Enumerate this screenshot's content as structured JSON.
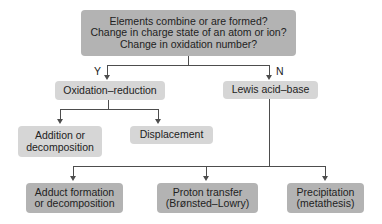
{
  "diagram": {
    "type": "flowchart",
    "root": {
      "lines": [
        "Elements combine or are formed?",
        "Change in charge state of an atom or ion?",
        "Change in oxidation number?"
      ]
    },
    "branch_labels": {
      "yes": "Y",
      "no": "N"
    },
    "level2": {
      "left": "Oxidation–reduction",
      "right": "Lewis acid–base"
    },
    "level3_redox": {
      "addition": [
        "Addition or",
        "decomposition"
      ],
      "displacement": "Displacement"
    },
    "level3_lewis": {
      "adduct": [
        "Adduct formation",
        "or decomposition"
      ],
      "proton": [
        "Proton transfer",
        "(Brønsted–Lowry)"
      ],
      "precipitation": [
        "Precipitation",
        "(metathesis)"
      ]
    },
    "colors": {
      "dark_box": "#b3b3b3",
      "light_box": "#d6d6d6",
      "line": "#4d4d4d"
    }
  }
}
